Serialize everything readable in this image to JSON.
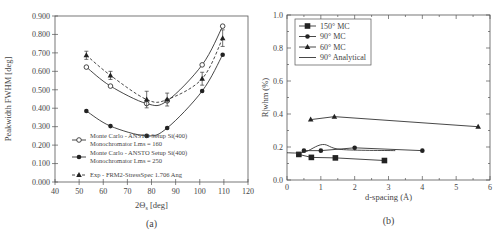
{
  "chart_data": [
    {
      "id": "a",
      "type": "line",
      "panel_label": "(a)",
      "title": "",
      "xlabel": "2Θs [deg]",
      "xlabel_main": "2Θ",
      "xlabel_sub": "s",
      "xlabel_tail": " [deg]",
      "ylabel": "Peakwidth FWHM [deg]",
      "xlim": [
        40,
        120
      ],
      "ylim": [
        0.0,
        0.9
      ],
      "xticks": [
        40,
        50,
        60,
        70,
        80,
        90,
        100,
        110,
        120
      ],
      "yticks": [
        "0.000",
        "0.100",
        "0.200",
        "0.300",
        "0.400",
        "0.500",
        "0.600",
        "0.700",
        "0.800",
        "0.900"
      ],
      "grid": false,
      "legend_position": "lower-left",
      "series": [
        {
          "name": "Monte Carlo - ANSTO Setup Si(400) Monochromator Lms = 160",
          "legend_line1": "Monte Carlo - ANSTO Setup Si(400)",
          "legend_line2": "Monochromator Lms = 160",
          "marker": "open-circle",
          "line": "solid",
          "x": [
            53,
            63,
            78,
            86.5,
            101,
            109.5
          ],
          "values": [
            0.623,
            0.52,
            0.425,
            0.44,
            0.635,
            0.845
          ]
        },
        {
          "name": "Monte Carlo - ANSTO Setup Si(400) Monochromator Lms = 250",
          "legend_line1": "Monte Carlo - ANSTO Setup Si(400)",
          "legend_line2": "Monochromator Lms = 250",
          "marker": "filled-circle",
          "line": "solid",
          "x": [
            53,
            63,
            78,
            86.5,
            101,
            109.5
          ],
          "values": [
            0.385,
            0.303,
            0.25,
            0.293,
            0.493,
            0.69
          ]
        },
        {
          "name": "Exp - FRM2-StressSpec 1.706 Ang",
          "legend_line1": "Exp - FRM2-StressSpec 1.706 Ang",
          "legend_line2": "",
          "marker": "filled-triangle",
          "line": "dashed",
          "x": [
            53,
            63,
            78,
            86.5,
            101,
            109.5
          ],
          "values": [
            0.687,
            0.578,
            0.447,
            0.447,
            0.56,
            0.78
          ],
          "error": [
            0.022,
            0.022,
            0.045,
            0.035,
            0.035,
            0.045
          ]
        }
      ]
    },
    {
      "id": "b",
      "type": "line",
      "panel_label": "(b)",
      "title": "",
      "xlabel": "d-spacing (Å)",
      "ylabel": "R|whm (%)",
      "xlim": [
        0,
        6
      ],
      "ylim": [
        0.0,
        1.0
      ],
      "xticks": [
        "0",
        "1",
        "2",
        "3",
        "4",
        "5",
        "6"
      ],
      "yticks": [
        "0.0",
        "0.2",
        "0.4",
        "0.6",
        "0.8",
        "1.0"
      ],
      "grid": false,
      "legend_position": "upper-left",
      "series": [
        {
          "name": "150° MC",
          "marker": "filled-square",
          "line": "solid",
          "x": [
            0.35,
            0.72,
            1.43,
            2.88
          ],
          "values": [
            0.155,
            0.137,
            0.134,
            0.118
          ]
        },
        {
          "name": "90° MC",
          "marker": "filled-circle",
          "line": "solid",
          "x": [
            0.5,
            1.0,
            2.0,
            4.0
          ],
          "values": [
            0.178,
            0.178,
            0.195,
            0.178
          ]
        },
        {
          "name": "60° MC",
          "marker": "filled-triangle",
          "line": "solid",
          "x": [
            0.7,
            1.4,
            5.65
          ],
          "values": [
            0.366,
            0.384,
            0.323
          ]
        },
        {
          "name": "90° Analytical",
          "marker": "none",
          "line": "solid",
          "x": [
            0.0,
            0.5,
            1.05,
            1.6,
            3.2
          ],
          "values": [
            0.165,
            0.168,
            0.215,
            0.185,
            0.178
          ]
        }
      ]
    }
  ]
}
